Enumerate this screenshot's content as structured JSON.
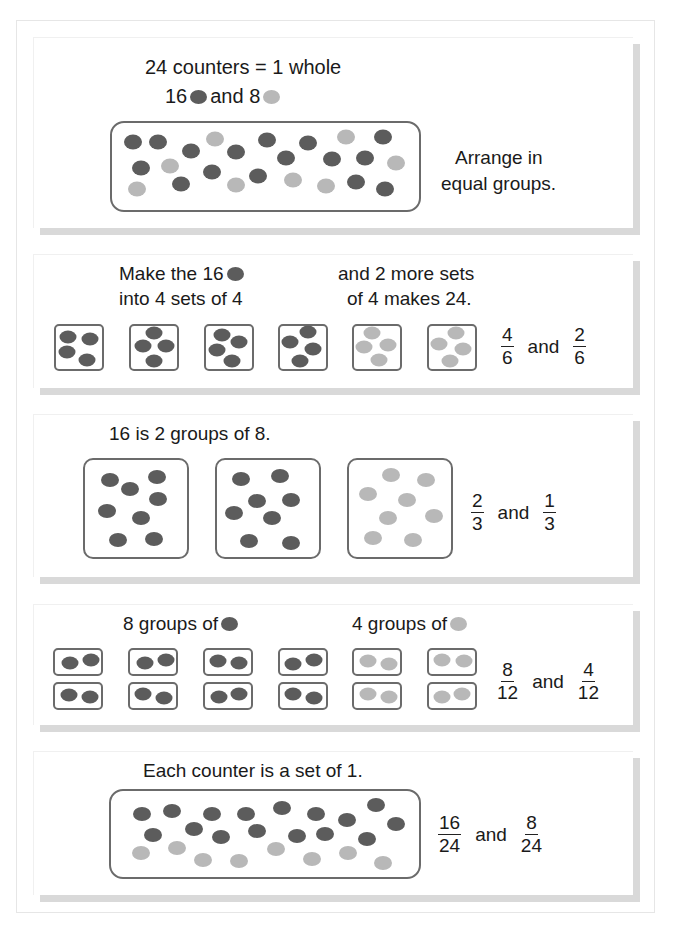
{
  "colors": {
    "dark": "#5c5c5c",
    "light": "#b8b8b8",
    "border": "#6b6b6b"
  },
  "section1": {
    "title": "24 counters = 1 whole",
    "subtitle_prefix": "16",
    "subtitle_mid": "and 8",
    "side_text_1": "Arrange in",
    "side_text_2": "equal groups.",
    "dots": [
      {
        "x": 133,
        "y": 142,
        "c": "dark"
      },
      {
        "x": 158,
        "y": 142,
        "c": "dark"
      },
      {
        "x": 191,
        "y": 151,
        "c": "dark"
      },
      {
        "x": 215,
        "y": 139,
        "c": "light"
      },
      {
        "x": 236,
        "y": 152,
        "c": "dark"
      },
      {
        "x": 141,
        "y": 168,
        "c": "dark"
      },
      {
        "x": 170,
        "y": 166,
        "c": "light"
      },
      {
        "x": 212,
        "y": 172,
        "c": "dark"
      },
      {
        "x": 181,
        "y": 184,
        "c": "dark"
      },
      {
        "x": 137,
        "y": 189,
        "c": "light"
      },
      {
        "x": 236,
        "y": 185,
        "c": "light"
      },
      {
        "x": 267,
        "y": 140,
        "c": "dark"
      },
      {
        "x": 308,
        "y": 143,
        "c": "dark"
      },
      {
        "x": 346,
        "y": 137,
        "c": "light"
      },
      {
        "x": 383,
        "y": 137,
        "c": "dark"
      },
      {
        "x": 286,
        "y": 158,
        "c": "dark"
      },
      {
        "x": 332,
        "y": 159,
        "c": "dark"
      },
      {
        "x": 365,
        "y": 158,
        "c": "dark"
      },
      {
        "x": 396,
        "y": 163,
        "c": "light"
      },
      {
        "x": 258,
        "y": 176,
        "c": "dark"
      },
      {
        "x": 293,
        "y": 180,
        "c": "light"
      },
      {
        "x": 326,
        "y": 186,
        "c": "light"
      },
      {
        "x": 356,
        "y": 182,
        "c": "dark"
      },
      {
        "x": 385,
        "y": 189,
        "c": "dark"
      }
    ]
  },
  "section2": {
    "left_line1": "Make the 16",
    "left_line2": "into 4 sets of 4",
    "right_line1": "and 2 more sets",
    "right_line2": "of 4 makes 24.",
    "boxes": [
      {
        "x": 54,
        "c": "dark",
        "dots": [
          [
            14,
            13
          ],
          [
            36,
            15
          ],
          [
            13,
            28
          ],
          [
            33,
            36
          ]
        ]
      },
      {
        "x": 129,
        "c": "dark",
        "dots": [
          [
            25,
            9
          ],
          [
            14,
            22
          ],
          [
            37,
            22
          ],
          [
            25,
            37
          ]
        ]
      },
      {
        "x": 204,
        "c": "dark",
        "dots": [
          [
            18,
            11
          ],
          [
            35,
            18
          ],
          [
            13,
            26
          ],
          [
            28,
            37
          ]
        ]
      },
      {
        "x": 278,
        "c": "dark",
        "dots": [
          [
            30,
            8
          ],
          [
            12,
            18
          ],
          [
            35,
            25
          ],
          [
            22,
            37
          ]
        ]
      },
      {
        "x": 352,
        "c": "light",
        "dots": [
          [
            20,
            9
          ],
          [
            12,
            23
          ],
          [
            36,
            21
          ],
          [
            27,
            36
          ]
        ]
      },
      {
        "x": 427,
        "c": "light",
        "dots": [
          [
            29,
            9
          ],
          [
            12,
            20
          ],
          [
            36,
            25
          ],
          [
            23,
            37
          ]
        ]
      }
    ],
    "fraction1": {
      "num": "4",
      "den": "6"
    },
    "and_label": "and",
    "fraction2": {
      "num": "2",
      "den": "6"
    }
  },
  "section3": {
    "title": "16 is 2 groups of 8.",
    "boxes": [
      {
        "x": 83,
        "c": "dark",
        "dots": [
          [
            27,
            22
          ],
          [
            47,
            31
          ],
          [
            74,
            19
          ],
          [
            75,
            41
          ],
          [
            24,
            53
          ],
          [
            58,
            60
          ],
          [
            35,
            82
          ],
          [
            71,
            81
          ]
        ]
      },
      {
        "x": 215,
        "c": "dark",
        "dots": [
          [
            26,
            21
          ],
          [
            65,
            18
          ],
          [
            42,
            43
          ],
          [
            76,
            42
          ],
          [
            19,
            55
          ],
          [
            57,
            60
          ],
          [
            34,
            83
          ],
          [
            76,
            85
          ]
        ]
      },
      {
        "x": 347,
        "c": "light",
        "dots": [
          [
            44,
            17
          ],
          [
            79,
            22
          ],
          [
            21,
            36
          ],
          [
            60,
            42
          ],
          [
            87,
            58
          ],
          [
            41,
            60
          ],
          [
            26,
            80
          ],
          [
            66,
            82
          ]
        ]
      }
    ],
    "fraction1": {
      "num": "2",
      "den": "3"
    },
    "and_label": "and",
    "fraction2": {
      "num": "1",
      "den": "3"
    }
  },
  "section4": {
    "left_label": "8 groups of",
    "right_label": "4 groups of",
    "columns": [
      {
        "x": 53,
        "c": "dark",
        "top": [
          [
            17,
            15
          ],
          [
            38,
            12
          ]
        ],
        "bottom": [
          [
            16,
            13
          ],
          [
            37,
            15
          ]
        ]
      },
      {
        "x": 128,
        "c": "dark",
        "top": [
          [
            17,
            15
          ],
          [
            38,
            12
          ]
        ],
        "bottom": [
          [
            15,
            12
          ],
          [
            36,
            16
          ]
        ]
      },
      {
        "x": 203,
        "c": "dark",
        "top": [
          [
            15,
            13
          ],
          [
            36,
            15
          ]
        ],
        "bottom": [
          [
            16,
            15
          ],
          [
            36,
            12
          ]
        ]
      },
      {
        "x": 278,
        "c": "dark",
        "top": [
          [
            15,
            16
          ],
          [
            36,
            12
          ]
        ],
        "bottom": [
          [
            15,
            12
          ],
          [
            36,
            16
          ]
        ]
      },
      {
        "x": 352,
        "c": "light",
        "top": [
          [
            16,
            13
          ],
          [
            37,
            16
          ]
        ],
        "bottom": [
          [
            16,
            12
          ],
          [
            37,
            15
          ]
        ]
      },
      {
        "x": 427,
        "c": "light",
        "top": [
          [
            15,
            12
          ],
          [
            37,
            13
          ]
        ],
        "bottom": [
          [
            15,
            15
          ],
          [
            35,
            12
          ]
        ]
      }
    ],
    "fraction1": {
      "num": "8",
      "den": "12"
    },
    "and_label": "and",
    "fraction2": {
      "num": "4",
      "den": "12"
    }
  },
  "section5": {
    "title": "Each counter is a set of 1.",
    "dots": [
      {
        "x": 142,
        "y": 814,
        "c": "dark"
      },
      {
        "x": 172,
        "y": 811,
        "c": "dark"
      },
      {
        "x": 212,
        "y": 814,
        "c": "dark"
      },
      {
        "x": 246,
        "y": 814,
        "c": "dark"
      },
      {
        "x": 282,
        "y": 808,
        "c": "dark"
      },
      {
        "x": 316,
        "y": 814,
        "c": "dark"
      },
      {
        "x": 347,
        "y": 820,
        "c": "dark"
      },
      {
        "x": 376,
        "y": 805,
        "c": "dark"
      },
      {
        "x": 396,
        "y": 824,
        "c": "dark"
      },
      {
        "x": 153,
        "y": 835,
        "c": "dark"
      },
      {
        "x": 194,
        "y": 829,
        "c": "dark"
      },
      {
        "x": 221,
        "y": 837,
        "c": "dark"
      },
      {
        "x": 257,
        "y": 831,
        "c": "dark"
      },
      {
        "x": 297,
        "y": 836,
        "c": "dark"
      },
      {
        "x": 325,
        "y": 834,
        "c": "dark"
      },
      {
        "x": 367,
        "y": 839,
        "c": "dark"
      },
      {
        "x": 141,
        "y": 853,
        "c": "light"
      },
      {
        "x": 177,
        "y": 848,
        "c": "light"
      },
      {
        "x": 203,
        "y": 860,
        "c": "light"
      },
      {
        "x": 239,
        "y": 861,
        "c": "light"
      },
      {
        "x": 276,
        "y": 849,
        "c": "light"
      },
      {
        "x": 312,
        "y": 859,
        "c": "light"
      },
      {
        "x": 348,
        "y": 853,
        "c": "light"
      },
      {
        "x": 383,
        "y": 863,
        "c": "light"
      }
    ],
    "fraction1": {
      "num": "16",
      "den": "24"
    },
    "and_label": "and",
    "fraction2": {
      "num": "8",
      "den": "24"
    }
  }
}
